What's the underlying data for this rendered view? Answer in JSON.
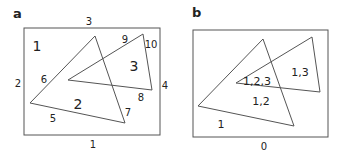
{
  "panels": [
    {
      "label": "a",
      "edge_labels": {
        "rect_top": "3",
        "rect_left": "2",
        "rect_right": "4",
        "rect_bottom": "1",
        "tri1_left_upper": "6",
        "tri1_bottom": "5",
        "tri1_right": "7",
        "tri2_top": "9",
        "tri2_right": "10",
        "tri2_bottom": "8"
      },
      "region_labels": {
        "outside": "1",
        "tri1_only": "2",
        "tri2_only": "3"
      }
    },
    {
      "label": "b",
      "edge_labels": {
        "rect_bottom": "0"
      },
      "region_labels": {
        "outside_tri": "1",
        "tri1": "1,2",
        "overlap": "1,2,3",
        "tri2": "1,3"
      }
    }
  ],
  "colors": {
    "stroke": "#555555",
    "text": "#222222"
  }
}
